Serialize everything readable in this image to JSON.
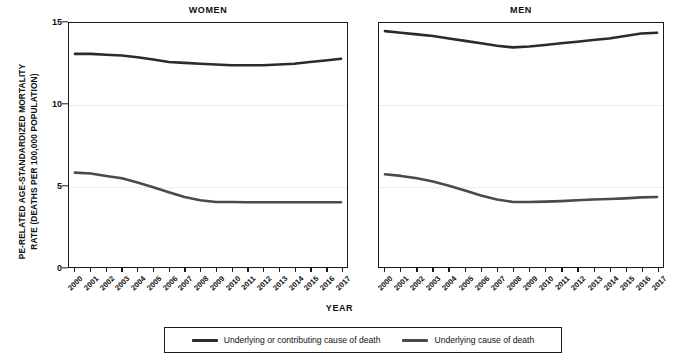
{
  "chart_data": {
    "type": "line",
    "title": "",
    "xlabel": "YEAR",
    "ylabel": "PE-RELATED AGE-STANDARDIZED MORTALITY\nRATE (DEATHS PER 100,000 POPULATION)",
    "ylim": [
      0,
      15
    ],
    "yticks": [
      0,
      5,
      10,
      15
    ],
    "ytick_labels": [
      "0",
      "5",
      "10",
      "15"
    ],
    "grid": "horizontal-faint",
    "legend_position": "bottom-center-boxed",
    "x": [
      2000,
      2001,
      2002,
      2003,
      2004,
      2005,
      2006,
      2007,
      2008,
      2009,
      2010,
      2011,
      2012,
      2013,
      2014,
      2015,
      2016,
      2017
    ],
    "xtick_labels": [
      "2000",
      "2001",
      "2002",
      "2003",
      "2004",
      "2005",
      "2006",
      "2007",
      "2008",
      "2009",
      "2010",
      "2011",
      "2012",
      "2013",
      "2014",
      "2015",
      "2016",
      "2017"
    ],
    "panels": [
      {
        "name": "WOMEN",
        "title": "WOMEN",
        "series": [
          {
            "name": "Underlying or contributing cause of death",
            "color": "#2b2b2b",
            "values": [
              13.1,
              13.1,
              13.05,
              13.0,
              12.9,
              12.75,
              12.6,
              12.55,
              12.5,
              12.45,
              12.4,
              12.4,
              12.4,
              12.45,
              12.5,
              12.6,
              12.7,
              12.8
            ]
          },
          {
            "name": "Underlying cause of death",
            "color": "#4a4a4a",
            "values": [
              5.8,
              5.75,
              5.6,
              5.45,
              5.2,
              4.9,
              4.6,
              4.3,
              4.1,
              4.0,
              4.0,
              3.98,
              3.98,
              3.98,
              3.98,
              3.98,
              3.98,
              3.98
            ]
          }
        ]
      },
      {
        "name": "MEN",
        "title": "MEN",
        "series": [
          {
            "name": "Underlying or contributing cause of death",
            "color": "#2b2b2b",
            "values": [
              14.5,
              14.4,
              14.3,
              14.2,
              14.05,
              13.9,
              13.75,
              13.6,
              13.5,
              13.55,
              13.65,
              13.75,
              13.85,
              13.95,
              14.05,
              14.2,
              14.35,
              14.4
            ]
          },
          {
            "name": "Underlying cause of death",
            "color": "#4a4a4a",
            "values": [
              5.7,
              5.6,
              5.45,
              5.25,
              5.0,
              4.7,
              4.4,
              4.15,
              4.0,
              4.0,
              4.02,
              4.05,
              4.1,
              4.15,
              4.18,
              4.22,
              4.28,
              4.3
            ]
          }
        ]
      }
    ],
    "legend": [
      {
        "label": "Underlying or contributing cause of death",
        "color": "#2b2b2b"
      },
      {
        "label": "Underlying cause of death",
        "color": "#4a4a4a"
      }
    ]
  }
}
